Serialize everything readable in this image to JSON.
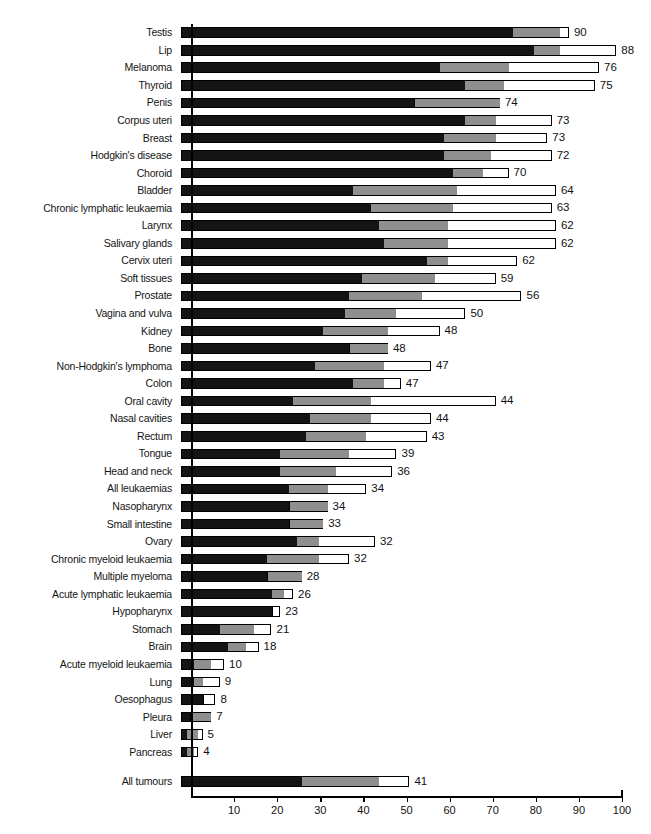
{
  "chart_data": {
    "type": "bar",
    "orientation": "horizontal",
    "title": "",
    "xlabel": "",
    "ylabel": "",
    "xlim": [
      0,
      100
    ],
    "grid": false,
    "legend": null,
    "stacked": true,
    "series": [
      {
        "name": "dark-segment",
        "color": "#141414"
      },
      {
        "name": "mid-segment",
        "color": "#8f8f8f"
      },
      {
        "name": "light-segment",
        "color": "#ffffff"
      }
    ],
    "axis_ticks": [
      0,
      10,
      20,
      30,
      40,
      50,
      60,
      70,
      80,
      90,
      100
    ],
    "axis_tick_labels": [
      "",
      "10",
      "20",
      "30",
      "40",
      "50",
      "60",
      "70",
      "80",
      "90",
      "100"
    ],
    "categories": [
      "Testis",
      "Lip",
      "Melanoma",
      "Thyroid",
      "Penis",
      "Corpus uteri",
      "Breast",
      "Hodgkin's disease",
      "Choroid",
      "Bladder",
      "Chronic lymphatic leukaemia",
      "Larynx",
      "Salivary glands",
      "Cervix uteri",
      "Soft tissues",
      "Prostate",
      "Vagina and vulva",
      "Kidney",
      "Bone",
      "Non-Hodgkin's lymphoma",
      "Colon",
      "Oral cavity",
      "Nasal cavities",
      "Rectum",
      "Tongue",
      "Head and neck",
      "All leukaemias",
      "Nasopharynx",
      "Small intestine",
      "Ovary",
      "Chronic myeloid leukaemia",
      "Multiple myeloma",
      "Acute lymphatic leukaemia",
      "Hypopharynx",
      "Stomach",
      "Brain",
      "Acute myeloid leukaemia",
      "Lung",
      "Oesophagus",
      "Pleura",
      "Liver",
      "Pancreas",
      "All tumours"
    ],
    "values": [
      90,
      88,
      76,
      75,
      74,
      73,
      73,
      72,
      70,
      64,
      63,
      62,
      62,
      62,
      59,
      56,
      50,
      48,
      48,
      47,
      47,
      44,
      44,
      43,
      39,
      36,
      34,
      34,
      33,
      32,
      32,
      28,
      26,
      23,
      21,
      18,
      10,
      9,
      8,
      7,
      5,
      4,
      41
    ],
    "rows": [
      {
        "label": "Testis",
        "value": 90,
        "dark": 77,
        "mid": 88,
        "light": 90
      },
      {
        "label": "Lip",
        "value": 88,
        "dark": 82,
        "mid": 88,
        "light": 101
      },
      {
        "label": "Melanoma",
        "value": 76,
        "dark": 60,
        "mid": 76,
        "light": 97
      },
      {
        "label": "Thyroid",
        "value": 75,
        "dark": 66,
        "mid": 75,
        "light": 96
      },
      {
        "label": "Penis",
        "value": 74,
        "dark": 54,
        "mid": 74,
        "light": 74
      },
      {
        "label": "Corpus uteri",
        "value": 73,
        "dark": 66,
        "mid": 73,
        "light": 86
      },
      {
        "label": "Breast",
        "value": 73,
        "dark": 61,
        "mid": 73,
        "light": 85
      },
      {
        "label": "Hodgkin's disease",
        "value": 72,
        "dark": 61,
        "mid": 72,
        "light": 86
      },
      {
        "label": "Choroid",
        "value": 70,
        "dark": 63,
        "mid": 70,
        "light": 76
      },
      {
        "label": "Bladder",
        "value": 64,
        "dark": 40,
        "mid": 64,
        "light": 87
      },
      {
        "label": "Chronic lymphatic leukaemia",
        "value": 63,
        "dark": 44,
        "mid": 63,
        "light": 86
      },
      {
        "label": "Larynx",
        "value": 62,
        "dark": 46,
        "mid": 62,
        "light": 87
      },
      {
        "label": "Salivary glands",
        "value": 62,
        "dark": 47,
        "mid": 62,
        "light": 87
      },
      {
        "label": "Cervix uteri",
        "value": 62,
        "dark": 57,
        "mid": 62,
        "light": 78
      },
      {
        "label": "Soft tissues",
        "value": 59,
        "dark": 42,
        "mid": 59,
        "light": 73
      },
      {
        "label": "Prostate",
        "value": 56,
        "dark": 39,
        "mid": 56,
        "light": 79
      },
      {
        "label": "Vagina and vulva",
        "value": 50,
        "dark": 38,
        "mid": 50,
        "light": 66
      },
      {
        "label": "Kidney",
        "value": 48,
        "dark": 33,
        "mid": 48,
        "light": 60
      },
      {
        "label": "Bone",
        "value": 48,
        "dark": 39,
        "mid": 48,
        "light": 48
      },
      {
        "label": "Non-Hodgkin's lymphoma",
        "value": 47,
        "dark": 31,
        "mid": 47,
        "light": 58
      },
      {
        "label": "Colon",
        "value": 47,
        "dark": 40,
        "mid": 47,
        "light": 51
      },
      {
        "label": "Oral cavity",
        "value": 44,
        "dark": 26,
        "mid": 44,
        "light": 73
      },
      {
        "label": "Nasal cavities",
        "value": 44,
        "dark": 30,
        "mid": 44,
        "light": 58
      },
      {
        "label": "Rectum",
        "value": 43,
        "dark": 29,
        "mid": 43,
        "light": 57
      },
      {
        "label": "Tongue",
        "value": 39,
        "dark": 23,
        "mid": 39,
        "light": 50
      },
      {
        "label": "Head and neck",
        "value": 36,
        "dark": 23,
        "mid": 36,
        "light": 49
      },
      {
        "label": "All leukaemias",
        "value": 34,
        "dark": 25,
        "mid": 34,
        "light": 43
      },
      {
        "label": "Nasopharynx",
        "value": 34,
        "dark": 25,
        "mid": 34,
        "light": 34
      },
      {
        "label": "Small intestine",
        "value": 33,
        "dark": 25,
        "mid": 33,
        "light": 33
      },
      {
        "label": "Ovary",
        "value": 32,
        "dark": 27,
        "mid": 32,
        "light": 45
      },
      {
        "label": "Chronic myeloid leukaemia",
        "value": 32,
        "dark": 20,
        "mid": 32,
        "light": 39
      },
      {
        "label": "Multiple myeloma",
        "value": 28,
        "dark": 20,
        "mid": 28,
        "light": 28
      },
      {
        "label": "Acute lymphatic leukaemia",
        "value": 26,
        "dark": 21,
        "mid": 24,
        "light": 26
      },
      {
        "label": "Hypopharynx",
        "value": 23,
        "dark": 21,
        "mid": 21,
        "light": 23
      },
      {
        "label": "Stomach",
        "value": 21,
        "dark": 9,
        "mid": 17,
        "light": 21
      },
      {
        "label": "Brain",
        "value": 18,
        "dark": 11,
        "mid": 15,
        "light": 18
      },
      {
        "label": "Acute myeloid leukaemia",
        "value": 10,
        "dark": 3,
        "mid": 7,
        "light": 10
      },
      {
        "label": "Lung",
        "value": 9,
        "dark": 3,
        "mid": 5,
        "light": 9
      },
      {
        "label": "Oesophagus",
        "value": 8,
        "dark": 5,
        "mid": 5,
        "light": 8
      },
      {
        "label": "Pleura",
        "value": 7,
        "dark": 2,
        "mid": 7,
        "light": 7
      },
      {
        "label": "Liver",
        "value": 5,
        "dark": 1.5,
        "mid": 4,
        "light": 5
      },
      {
        "label": "Pancreas",
        "value": 4,
        "dark": 1.5,
        "mid": 3,
        "light": 4
      },
      {
        "label": "All tumours",
        "value": 41,
        "dark": 28,
        "mid": 46,
        "light": 53
      }
    ],
    "spacer_before_last": true
  }
}
